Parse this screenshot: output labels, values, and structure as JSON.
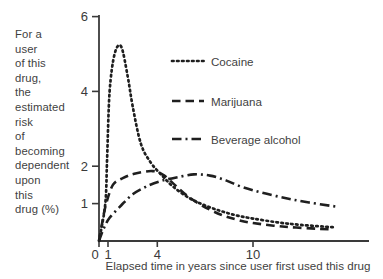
{
  "figure": {
    "background": "#ffffff",
    "ink_color": "#1f1f1f",
    "text_color": "#3f3f3f",
    "y_axis_label_lines": [
      "For a",
      "user",
      "of this",
      "drug,",
      "the",
      "estimated",
      "risk",
      "of",
      "becoming",
      "dependent",
      "upon",
      "this",
      "drug (%)"
    ],
    "x_axis_label": "Elapsed time in years since user first used this drug",
    "legend": [
      {
        "label": "Cocaine",
        "style": "dotted"
      },
      {
        "label": "Marijuana",
        "style": "dashed"
      },
      {
        "label": "Beverage alcohol",
        "style": "dash-dot"
      }
    ]
  },
  "chart_data": {
    "type": "line",
    "title": "",
    "xlabel": "Elapsed time in years since user first used this drug",
    "ylabel": "For a user of this drug, the estimated risk of becoming dependent upon this drug (%)",
    "xlim": [
      0,
      17
    ],
    "ylim": [
      0,
      6
    ],
    "x_ticks": [
      0,
      1,
      4,
      10
    ],
    "y_ticks": [
      6,
      4,
      2,
      1
    ],
    "grid": false,
    "legend_position": "upper right",
    "series": [
      {
        "name": "Cocaine",
        "line_style": "dotted",
        "points": [
          [
            0,
            0
          ],
          [
            0.7,
            1.0
          ],
          [
            0.9,
            2.2
          ],
          [
            1.1,
            4.0
          ],
          [
            1.4,
            5.0
          ],
          [
            1.8,
            5.2
          ],
          [
            2.2,
            4.4
          ],
          [
            2.5,
            3.6
          ],
          [
            3.0,
            2.6
          ],
          [
            3.6,
            2.1
          ],
          [
            4.3,
            1.75
          ],
          [
            5,
            1.45
          ],
          [
            6,
            1.15
          ],
          [
            7,
            0.95
          ],
          [
            8,
            0.8
          ],
          [
            9,
            0.68
          ],
          [
            10,
            0.6
          ],
          [
            11.5,
            0.5
          ],
          [
            13,
            0.43
          ],
          [
            15,
            0.37
          ]
        ]
      },
      {
        "name": "Marijuana",
        "line_style": "dashed",
        "points": [
          [
            0,
            0
          ],
          [
            0.4,
            0.55
          ],
          [
            0.8,
            1.0
          ],
          [
            1.3,
            1.5
          ],
          [
            1.9,
            1.68
          ],
          [
            2.6,
            1.8
          ],
          [
            3.7,
            1.87
          ],
          [
            4.4,
            1.76
          ],
          [
            5.1,
            1.5
          ],
          [
            5.9,
            1.2
          ],
          [
            6.8,
            0.95
          ],
          [
            8,
            0.7
          ],
          [
            9,
            0.57
          ],
          [
            10,
            0.48
          ],
          [
            12,
            0.38
          ],
          [
            14,
            0.33
          ],
          [
            15,
            0.31
          ]
        ]
      },
      {
        "name": "Beverage alcohol",
        "line_style": "dash-dot",
        "points": [
          [
            0,
            0
          ],
          [
            0.5,
            0.32
          ],
          [
            1.1,
            0.62
          ],
          [
            1.8,
            0.95
          ],
          [
            2.5,
            1.25
          ],
          [
            3.3,
            1.45
          ],
          [
            4.2,
            1.6
          ],
          [
            5.2,
            1.7
          ],
          [
            6.3,
            1.78
          ],
          [
            7.3,
            1.75
          ],
          [
            8.3,
            1.62
          ],
          [
            9.3,
            1.45
          ],
          [
            10.5,
            1.3
          ],
          [
            12,
            1.15
          ],
          [
            13.5,
            1.03
          ],
          [
            15.2,
            0.92
          ]
        ]
      }
    ]
  }
}
